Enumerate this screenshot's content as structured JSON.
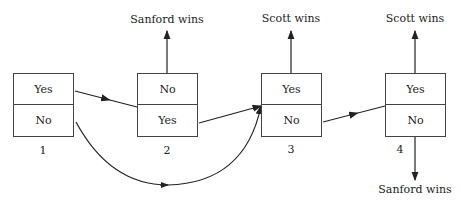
{
  "boxes": [
    {
      "number": "1",
      "top": "Yes",
      "bottom": "No"
    },
    {
      "number": "2",
      "top": "No",
      "bottom": "Yes"
    },
    {
      "number": "3",
      "top": "Yes",
      "bottom": "No"
    },
    {
      "number": "4",
      "top": "Yes",
      "bottom": "No"
    }
  ],
  "outcomes": {
    "box2_top": "Sanford wins",
    "box3_top": "Scott wins",
    "box4_top": "Scott wins",
    "box4_bottom": "Sanford wins"
  }
}
